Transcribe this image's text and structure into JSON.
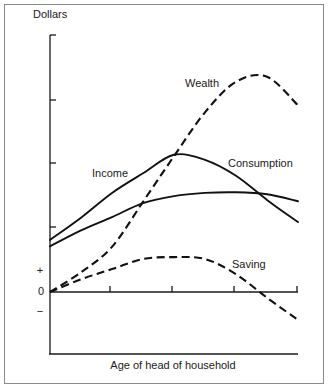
{
  "chart_data": {
    "type": "line",
    "title": "",
    "xlabel": "Age of head of household",
    "ylabel": "Dollars",
    "y_sign_labels": {
      "plus": "+",
      "zero": "0",
      "minus": "−"
    },
    "x_ticks": 4,
    "y_ticks": 3,
    "xlim": [
      0,
      4
    ],
    "ylim": [
      -1,
      4
    ],
    "grid": false,
    "legend": "inline labels",
    "x": [
      0,
      0.5,
      1,
      1.5,
      2,
      2.5,
      3,
      3.5,
      4
    ],
    "series": [
      {
        "name": "Income",
        "style": "solid",
        "values": [
          0.82,
          1.17,
          1.56,
          1.87,
          2.16,
          2.08,
          1.83,
          1.45,
          1.1
        ]
      },
      {
        "name": "Consumption",
        "style": "solid",
        "values": [
          0.72,
          0.97,
          1.18,
          1.4,
          1.51,
          1.56,
          1.57,
          1.54,
          1.43
        ]
      },
      {
        "name": "Wealth",
        "style": "dashed",
        "values": [
          0.0,
          0.31,
          0.71,
          1.42,
          2.14,
          2.83,
          3.31,
          3.39,
          2.94
        ]
      },
      {
        "name": "Saving",
        "style": "dashed",
        "values": [
          0.0,
          0.2,
          0.36,
          0.52,
          0.55,
          0.52,
          0.28,
          -0.09,
          -0.44
        ]
      }
    ]
  }
}
